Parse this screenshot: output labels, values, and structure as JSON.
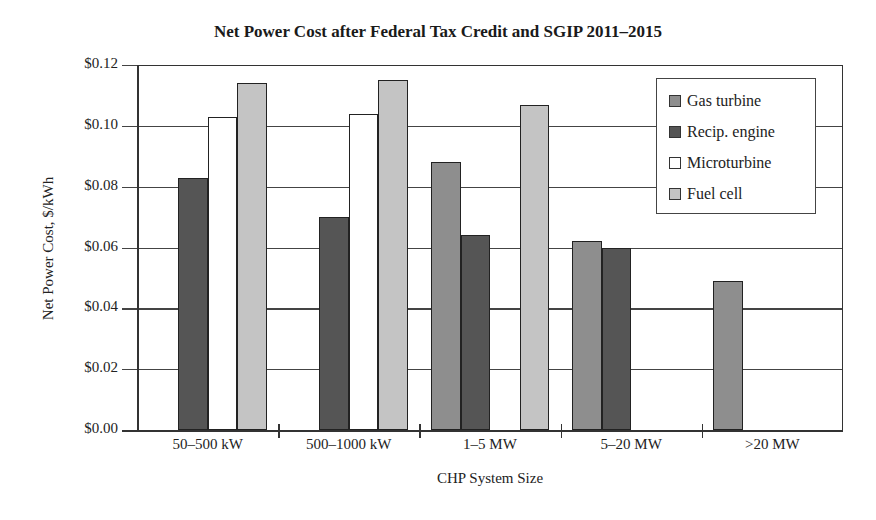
{
  "chart_data": {
    "type": "bar",
    "title": "Net Power Cost after Federal Tax Credit and SGIP 2011–2015",
    "xlabel": "CHP System Size",
    "ylabel": "Net Power Cost, $/kWh",
    "ylim": [
      0,
      0.12
    ],
    "yticks": [
      "$0.00",
      "$0.02",
      "$0.04",
      "$0.06",
      "$0.08",
      "$0.10",
      "$0.12"
    ],
    "grid": true,
    "legend_position": "upper right",
    "categories": [
      "50–500 kW",
      "500–1000 kW",
      "1–5 MW",
      "5–20 MW",
      ">20 MW"
    ],
    "series": [
      {
        "name": "Gas turbine",
        "color": "#8e8e8e",
        "values": [
          null,
          null,
          0.088,
          0.062,
          0.049
        ]
      },
      {
        "name": "Recip. engine",
        "color": "#555555",
        "values": [
          0.083,
          0.07,
          0.064,
          0.06,
          null
        ]
      },
      {
        "name": "Microturbine",
        "color": "#ffffff",
        "values": [
          0.103,
          0.104,
          null,
          null,
          null
        ]
      },
      {
        "name": "Fuel cell",
        "color": "#c4c4c4",
        "values": [
          0.114,
          0.115,
          0.107,
          null,
          null
        ]
      }
    ]
  }
}
